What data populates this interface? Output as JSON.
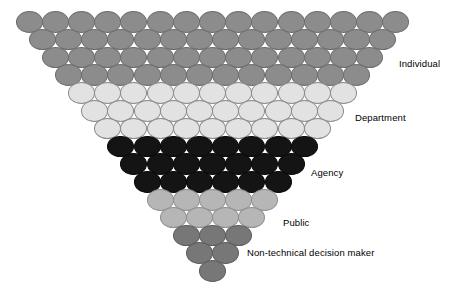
{
  "figure": {
    "type": "pyramid-diagram",
    "title": "",
    "background_color": "#ffffff",
    "width": 460,
    "height": 295,
    "circle": {
      "width": 27,
      "height": 21.5,
      "x_spacing": 26.2,
      "y_spacing": 17.8,
      "border_color": "#777777"
    }
  },
  "groups": [
    {
      "key": "individual",
      "label": "Individual",
      "color": "#8c8c8c",
      "border_color": "#6e6e6e",
      "row_counts": [
        15,
        14,
        13,
        12
      ],
      "count": 54,
      "label_x": 399,
      "label_y": 58
    },
    {
      "key": "department",
      "label": "Department",
      "color": "#e2e2e2",
      "border_color": "#8a8a8a",
      "row_counts": [
        11,
        10,
        9
      ],
      "count": 30,
      "label_x": 355,
      "label_y": 112
    },
    {
      "key": "agency",
      "label": "Agency",
      "color": "#141414",
      "border_color": "#0a0a0a",
      "row_counts": [
        8,
        7,
        6
      ],
      "count": 21,
      "label_x": 311,
      "label_y": 167
    },
    {
      "key": "public",
      "label": "Public",
      "color": "#b6b6b6",
      "border_color": "#8f8f8f",
      "row_counts": [
        5,
        4
      ],
      "count": 9,
      "label_x": 283,
      "label_y": 217
    },
    {
      "key": "non-technical-decision-maker",
      "label": "Non-technical decision maker",
      "color": "#777777",
      "border_color": "#5e5e5e",
      "row_counts": [
        3,
        2,
        1
      ],
      "count": 6,
      "label_x": 247,
      "label_y": 247
    }
  ],
  "chart_data": {
    "type": "bar",
    "title": "",
    "xlabel": "",
    "ylabel": "",
    "categories": [
      "Individual",
      "Department",
      "Agency",
      "Public",
      "Non-technical decision maker"
    ],
    "values": [
      54,
      30,
      21,
      9,
      6
    ],
    "row_counts": [
      15,
      14,
      13,
      12,
      11,
      10,
      9,
      8,
      7,
      6,
      5,
      4,
      3,
      2,
      1
    ],
    "total_nodes": 120,
    "rows": 15,
    "legend_position": "right",
    "grid": false
  }
}
